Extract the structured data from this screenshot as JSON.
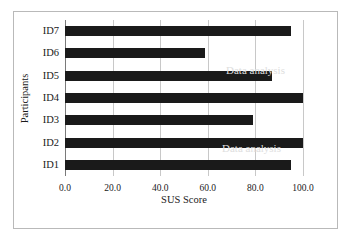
{
  "chart_data": {
    "type": "bar",
    "orientation": "horizontal",
    "title": "",
    "xlabel": "SUS Score",
    "ylabel": "Participants",
    "categories": [
      "ID1",
      "ID2",
      "ID3",
      "ID4",
      "ID5",
      "ID6",
      "ID7"
    ],
    "values": [
      95,
      100,
      79,
      100,
      87,
      59,
      95
    ],
    "display_order_top_to_bottom": [
      "ID7",
      "ID6",
      "ID5",
      "ID4",
      "ID3",
      "ID2",
      "ID1"
    ],
    "xlim": [
      0,
      100
    ],
    "xticks": [
      0,
      20,
      40,
      60,
      80,
      100
    ],
    "xtick_labels": [
      "0.0",
      "20.0",
      "40.0",
      "60.0",
      "80.0",
      "100.0"
    ],
    "grid": "vertical",
    "legend": "none",
    "bar_color": "#1a1a1a",
    "grid_color": "#c8c8c8",
    "axis_color": "#7a7a7a",
    "frame_color": "#b9b9b9",
    "background": "#ffffff"
  },
  "artifacts": [
    {
      "text": "Data analysis",
      "x": 212,
      "y": 52
    },
    {
      "text": "Data analysis",
      "x": 208,
      "y": 130
    }
  ]
}
